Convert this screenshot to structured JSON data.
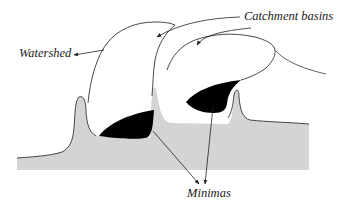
{
  "diagram": {
    "type": "watershed-segmentation-illustration",
    "labels": {
      "catchment_basins": "Catchment basins",
      "watershed": "Watershed",
      "minimas": "Minimas"
    },
    "colors": {
      "terrain_fill": "#d4d4d4",
      "minima_fill": "#000000",
      "stroke": "#333333",
      "label_text": "#1a1a1a",
      "background": "#ffffff"
    },
    "components": [
      {
        "id": "terrain",
        "description": "Gray landscape profile with two peaks"
      },
      {
        "id": "minima-left",
        "description": "Black basin minimum, left"
      },
      {
        "id": "minima-right",
        "description": "Black basin minimum, right"
      },
      {
        "id": "catchment-basin-left",
        "description": "Outline of left catchment basin (flooded region)"
      },
      {
        "id": "catchment-basin-right",
        "description": "Outline of right catchment basin"
      },
      {
        "id": "watershed-line",
        "description": "Boundary between basins"
      }
    ],
    "arrows": [
      {
        "from": "catchment_basins",
        "to": "catchment-basin-left"
      },
      {
        "from": "catchment_basins",
        "to": "catchment-basin-right"
      },
      {
        "from": "watershed",
        "to": "watershed-line"
      },
      {
        "from": "minimas",
        "to": "minima-left"
      },
      {
        "from": "minimas",
        "to": "minima-right"
      }
    ]
  }
}
